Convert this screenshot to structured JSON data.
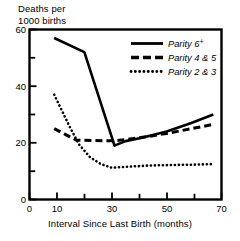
{
  "chart_data": {
    "type": "line",
    "title": "",
    "subtitle": "",
    "xlabel": "Interval Since Last Birth (months)",
    "ylabel": "Deaths per\n1000 births",
    "ylabel_line1": "Deaths per",
    "ylabel_line2": "1000 births",
    "xlim": [
      0,
      70
    ],
    "ylim": [
      0,
      60
    ],
    "grid": false,
    "legend_position": "top-right-inside",
    "x_ticks_major": [
      0,
      10,
      30,
      50,
      70
    ],
    "x_ticks_minor": [
      20,
      40,
      60
    ],
    "x_tick_labels": [
      "0",
      "10",
      "30",
      "50",
      "70"
    ],
    "y_ticks_major": [
      0,
      20,
      40,
      60
    ],
    "y_ticks_minor": [
      10,
      30,
      50
    ],
    "y_tick_labels": [
      "0",
      "20",
      "40",
      "60"
    ],
    "series": [
      {
        "name": "Parity 6+",
        "name_base": "Parity 6",
        "name_sup": "+",
        "style": "solid",
        "color": "#000000",
        "points": [
          [
            9,
            57.0
          ],
          [
            20,
            52.0
          ],
          [
            31,
            19.0
          ],
          [
            35,
            20.6
          ],
          [
            41,
            21.8
          ],
          [
            50,
            24.0
          ],
          [
            59,
            27.0
          ],
          [
            67,
            30.0
          ]
        ]
      },
      {
        "name": "Parity 4 & 5",
        "style": "dashed",
        "color": "#000000",
        "points": [
          [
            9,
            25.0
          ],
          [
            13,
            23.0
          ],
          [
            17,
            21.0
          ],
          [
            24,
            20.8
          ],
          [
            31,
            20.7
          ],
          [
            36,
            21.3
          ],
          [
            43,
            22.2
          ],
          [
            51,
            23.5
          ],
          [
            59,
            25.0
          ],
          [
            67,
            26.5
          ]
        ]
      },
      {
        "name": "Parity 2 & 3",
        "style": "dotted",
        "color": "#000000",
        "points": [
          [
            9,
            37.0
          ],
          [
            12,
            31.0
          ],
          [
            15,
            25.0
          ],
          [
            18,
            19.5
          ],
          [
            22,
            15.0
          ],
          [
            26,
            12.5
          ],
          [
            30,
            11.2
          ],
          [
            36,
            11.6
          ],
          [
            44,
            12.0
          ],
          [
            53,
            12.2
          ],
          [
            60,
            12.3
          ],
          [
            67,
            12.5
          ]
        ]
      }
    ]
  }
}
